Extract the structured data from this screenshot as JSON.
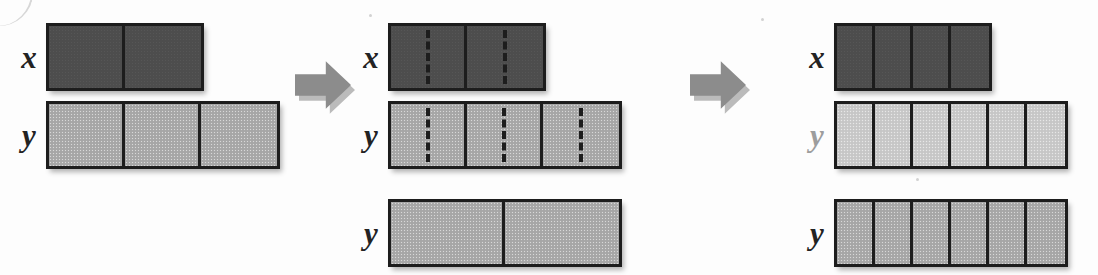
{
  "figure": {
    "colors": {
      "dark_fill": "#4d4d4d",
      "mid_fill": "#a9a9a9",
      "light_fill": "#cacaca",
      "border": "#1d1d1d",
      "arrow_fill": "#8c8c8c",
      "label": "#232323",
      "label_muted": "#9d9d9d",
      "background": "#fdfdfd"
    },
    "arrows": [
      {
        "name": "arrow-step-1",
        "direction": "right"
      },
      {
        "name": "arrow-step-2",
        "direction": "right"
      }
    ],
    "panels": [
      {
        "name": "panel-initial",
        "rows": [
          {
            "name": "row-x-initial",
            "label": "x",
            "label_muted": false,
            "cell_count": 2,
            "cell_width": 76,
            "fill": "dark",
            "split": false
          },
          {
            "name": "row-y-initial",
            "label": "y",
            "label_muted": false,
            "cell_count": 3,
            "cell_width": 76,
            "fill": "mid",
            "split": false
          }
        ]
      },
      {
        "name": "panel-split",
        "rows": [
          {
            "name": "row-x-split",
            "label": "x",
            "label_muted": false,
            "cell_count": 2,
            "cell_width": 76,
            "fill": "dark",
            "split": true
          },
          {
            "name": "row-y-split",
            "label": "y",
            "label_muted": false,
            "cell_count": 3,
            "cell_width": 76,
            "fill": "mid",
            "split": true
          },
          {
            "name": "row-y-merged",
            "label": "y",
            "label_muted": false,
            "cell_count": 2,
            "cell_width": 114,
            "fill": "mid",
            "split": false
          }
        ]
      },
      {
        "name": "panel-result",
        "rows": [
          {
            "name": "row-x-result",
            "label": "x",
            "label_muted": false,
            "cell_count": 4,
            "cell_width": 38,
            "fill": "dark",
            "split": false
          },
          {
            "name": "row-y-result-faded",
            "label": "y",
            "label_muted": true,
            "cell_count": 6,
            "cell_width": 38,
            "fill": "light",
            "split": false
          },
          {
            "name": "row-y-result",
            "label": "y",
            "label_muted": false,
            "cell_count": 6,
            "cell_width": 38,
            "fill": "mid",
            "split": false
          }
        ]
      }
    ]
  }
}
